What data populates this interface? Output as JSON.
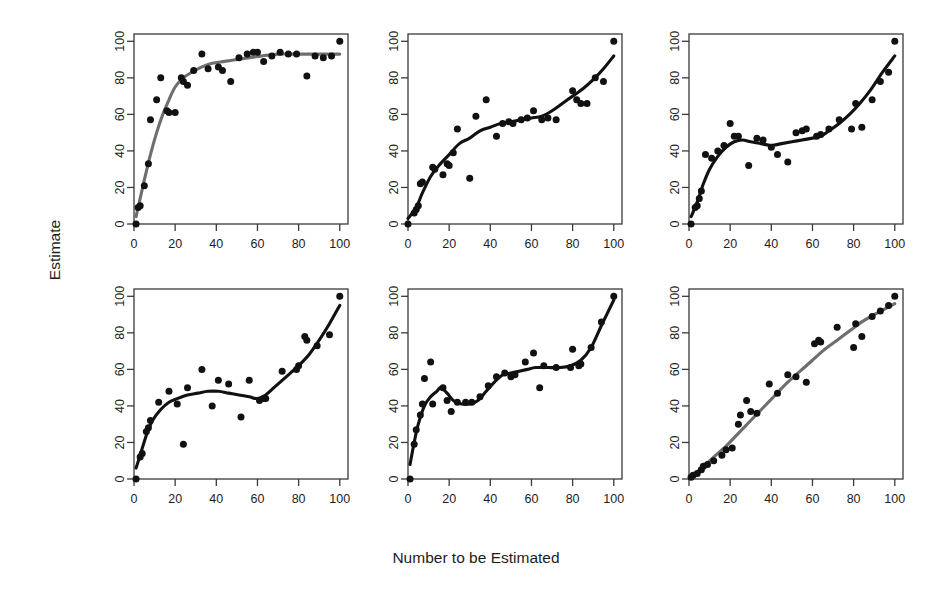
{
  "figure": {
    "xlabel": "Number to be Estimated",
    "ylabel": "Estimate",
    "layout": {
      "rows": 2,
      "cols": 3
    }
  },
  "chart_data": [
    {
      "panel": 1,
      "position": "top-left",
      "type": "scatter",
      "title": "",
      "xlabel": "Number to be Estimated",
      "ylabel": "Estimate",
      "xlim": [
        0,
        104
      ],
      "ylim": [
        0,
        104
      ],
      "xticks": [
        0,
        20,
        40,
        60,
        80,
        100
      ],
      "yticks": [
        0,
        20,
        40,
        60,
        80,
        100
      ],
      "grid": false,
      "legend": "none",
      "point_color": "#111111",
      "curve_color": "#6e6e6e",
      "curve_style": "loess-smooth",
      "points": [
        [
          1,
          0
        ],
        [
          2,
          9
        ],
        [
          3,
          10
        ],
        [
          5,
          21
        ],
        [
          7,
          33
        ],
        [
          8,
          57
        ],
        [
          11,
          68
        ],
        [
          13,
          80
        ],
        [
          16,
          62
        ],
        [
          17,
          61
        ],
        [
          20,
          61
        ],
        [
          23,
          80
        ],
        [
          24,
          78
        ],
        [
          26,
          76
        ],
        [
          29,
          84
        ],
        [
          33,
          93
        ],
        [
          36,
          85
        ],
        [
          41,
          86
        ],
        [
          43,
          84
        ],
        [
          47,
          78
        ],
        [
          51,
          91
        ],
        [
          55,
          93
        ],
        [
          58,
          94
        ],
        [
          60,
          94
        ],
        [
          63,
          89
        ],
        [
          67,
          92
        ],
        [
          71,
          94
        ],
        [
          75,
          93
        ],
        [
          79,
          93
        ],
        [
          84,
          81
        ],
        [
          88,
          92
        ],
        [
          92,
          91
        ],
        [
          96,
          92
        ],
        [
          100,
          100
        ]
      ],
      "curve": [
        [
          1,
          4
        ],
        [
          3,
          14
        ],
        [
          5,
          24
        ],
        [
          8,
          38
        ],
        [
          11,
          50
        ],
        [
          14,
          60
        ],
        [
          17,
          68
        ],
        [
          20,
          75
        ],
        [
          24,
          80
        ],
        [
          28,
          83
        ],
        [
          33,
          86
        ],
        [
          38,
          88
        ],
        [
          44,
          89
        ],
        [
          50,
          90
        ],
        [
          56,
          91
        ],
        [
          62,
          92
        ],
        [
          70,
          93
        ],
        [
          78,
          93
        ],
        [
          86,
          93
        ],
        [
          94,
          93
        ],
        [
          100,
          93
        ]
      ]
    },
    {
      "panel": 2,
      "position": "top-center",
      "type": "scatter",
      "title": "",
      "xlabel": "Number to be Estimated",
      "ylabel": "Estimate",
      "xlim": [
        0,
        104
      ],
      "ylim": [
        0,
        104
      ],
      "xticks": [
        0,
        20,
        40,
        60,
        80,
        100
      ],
      "yticks": [
        0,
        20,
        40,
        60,
        80,
        100
      ],
      "grid": false,
      "legend": "none",
      "point_color": "#111111",
      "curve_color": "#111111",
      "curve_style": "loess-smooth",
      "points": [
        [
          0,
          0
        ],
        [
          3,
          6
        ],
        [
          4,
          8
        ],
        [
          5,
          10
        ],
        [
          6,
          22
        ],
        [
          7,
          23
        ],
        [
          12,
          31
        ],
        [
          13,
          30
        ],
        [
          17,
          27
        ],
        [
          19,
          33
        ],
        [
          20,
          32
        ],
        [
          22,
          39
        ],
        [
          24,
          52
        ],
        [
          30,
          25
        ],
        [
          33,
          59
        ],
        [
          38,
          68
        ],
        [
          43,
          48
        ],
        [
          46,
          55
        ],
        [
          49,
          56
        ],
        [
          51,
          55
        ],
        [
          55,
          57
        ],
        [
          58,
          58
        ],
        [
          61,
          62
        ],
        [
          65,
          57
        ],
        [
          68,
          58
        ],
        [
          72,
          57
        ],
        [
          80,
          73
        ],
        [
          82,
          68
        ],
        [
          84,
          66
        ],
        [
          87,
          66
        ],
        [
          91,
          80
        ],
        [
          95,
          78
        ],
        [
          100,
          100
        ]
      ],
      "curve": [
        [
          0,
          3
        ],
        [
          4,
          9
        ],
        [
          7,
          17
        ],
        [
          11,
          26
        ],
        [
          15,
          32
        ],
        [
          20,
          38
        ],
        [
          25,
          44
        ],
        [
          30,
          47
        ],
        [
          35,
          51
        ],
        [
          40,
          53
        ],
        [
          45,
          55
        ],
        [
          50,
          56
        ],
        [
          55,
          57
        ],
        [
          60,
          58
        ],
        [
          65,
          59
        ],
        [
          70,
          62
        ],
        [
          75,
          66
        ],
        [
          80,
          70
        ],
        [
          85,
          74
        ],
        [
          90,
          79
        ],
        [
          95,
          85
        ],
        [
          100,
          92
        ]
      ]
    },
    {
      "panel": 3,
      "position": "top-right",
      "type": "scatter",
      "title": "",
      "xlabel": "Number to be Estimated",
      "ylabel": "Estimate",
      "xlim": [
        0,
        104
      ],
      "ylim": [
        0,
        104
      ],
      "xticks": [
        0,
        20,
        40,
        60,
        80,
        100
      ],
      "yticks": [
        0,
        20,
        40,
        60,
        80,
        100
      ],
      "grid": false,
      "legend": "none",
      "point_color": "#111111",
      "curve_color": "#111111",
      "curve_style": "loess-smooth",
      "points": [
        [
          1,
          0
        ],
        [
          3,
          9
        ],
        [
          4,
          10
        ],
        [
          5,
          14
        ],
        [
          6,
          18
        ],
        [
          8,
          38
        ],
        [
          11,
          36
        ],
        [
          14,
          40
        ],
        [
          17,
          43
        ],
        [
          20,
          55
        ],
        [
          22,
          48
        ],
        [
          24,
          48
        ],
        [
          29,
          32
        ],
        [
          33,
          47
        ],
        [
          36,
          46
        ],
        [
          40,
          42
        ],
        [
          43,
          38
        ],
        [
          48,
          34
        ],
        [
          52,
          50
        ],
        [
          55,
          51
        ],
        [
          57,
          52
        ],
        [
          62,
          48
        ],
        [
          64,
          49
        ],
        [
          68,
          52
        ],
        [
          73,
          57
        ],
        [
          79,
          52
        ],
        [
          81,
          66
        ],
        [
          84,
          53
        ],
        [
          89,
          68
        ],
        [
          93,
          78
        ],
        [
          97,
          83
        ],
        [
          100,
          100
        ]
      ],
      "curve": [
        [
          1,
          4
        ],
        [
          4,
          12
        ],
        [
          7,
          22
        ],
        [
          10,
          30
        ],
        [
          14,
          37
        ],
        [
          18,
          42
        ],
        [
          22,
          45
        ],
        [
          26,
          46
        ],
        [
          30,
          45
        ],
        [
          35,
          44
        ],
        [
          40,
          43
        ],
        [
          45,
          44
        ],
        [
          50,
          45
        ],
        [
          55,
          46
        ],
        [
          60,
          47
        ],
        [
          64,
          48
        ],
        [
          68,
          51
        ],
        [
          73,
          55
        ],
        [
          78,
          60
        ],
        [
          83,
          66
        ],
        [
          88,
          73
        ],
        [
          94,
          83
        ],
        [
          100,
          92
        ]
      ]
    },
    {
      "panel": 4,
      "position": "bottom-left",
      "type": "scatter",
      "title": "",
      "xlabel": "Number to be Estimated",
      "ylabel": "Estimate",
      "xlim": [
        0,
        104
      ],
      "ylim": [
        0,
        104
      ],
      "xticks": [
        0,
        20,
        40,
        60,
        80,
        100
      ],
      "yticks": [
        0,
        20,
        40,
        60,
        80,
        100
      ],
      "grid": false,
      "legend": "none",
      "point_color": "#111111",
      "curve_color": "#111111",
      "curve_style": "loess-smooth",
      "points": [
        [
          1,
          0
        ],
        [
          3,
          12
        ],
        [
          4,
          14
        ],
        [
          6,
          26
        ],
        [
          7,
          28
        ],
        [
          8,
          32
        ],
        [
          12,
          42
        ],
        [
          17,
          48
        ],
        [
          21,
          41
        ],
        [
          24,
          19
        ],
        [
          26,
          50
        ],
        [
          33,
          60
        ],
        [
          38,
          40
        ],
        [
          41,
          54
        ],
        [
          46,
          52
        ],
        [
          52,
          34
        ],
        [
          56,
          54
        ],
        [
          61,
          43
        ],
        [
          63,
          44
        ],
        [
          64,
          44
        ],
        [
          72,
          59
        ],
        [
          79,
          60
        ],
        [
          80,
          62
        ],
        [
          84,
          76
        ],
        [
          83,
          78
        ],
        [
          89,
          73
        ],
        [
          95,
          79
        ],
        [
          100,
          100
        ]
      ],
      "curve": [
        [
          1,
          6
        ],
        [
          3,
          13
        ],
        [
          6,
          24
        ],
        [
          9,
          32
        ],
        [
          13,
          38
        ],
        [
          17,
          42
        ],
        [
          21,
          44
        ],
        [
          26,
          46
        ],
        [
          31,
          47
        ],
        [
          36,
          48
        ],
        [
          41,
          48
        ],
        [
          46,
          47
        ],
        [
          51,
          46
        ],
        [
          56,
          45
        ],
        [
          60,
          44
        ],
        [
          64,
          46
        ],
        [
          68,
          50
        ],
        [
          72,
          54
        ],
        [
          76,
          58
        ],
        [
          80,
          62
        ],
        [
          85,
          68
        ],
        [
          90,
          76
        ],
        [
          95,
          85
        ],
        [
          100,
          95
        ]
      ]
    },
    {
      "panel": 5,
      "position": "bottom-center",
      "type": "scatter",
      "title": "",
      "xlabel": "Number to be Estimated",
      "ylabel": "Estimate",
      "xlim": [
        0,
        104
      ],
      "ylim": [
        0,
        104
      ],
      "xticks": [
        0,
        20,
        40,
        60,
        80,
        100
      ],
      "yticks": [
        0,
        20,
        40,
        60,
        80,
        100
      ],
      "grid": false,
      "legend": "none",
      "point_color": "#111111",
      "curve_color": "#111111",
      "curve_style": "loess-smooth",
      "points": [
        [
          1,
          0
        ],
        [
          3,
          19
        ],
        [
          4,
          27
        ],
        [
          6,
          35
        ],
        [
          7,
          41
        ],
        [
          8,
          55
        ],
        [
          11,
          64
        ],
        [
          12,
          41
        ],
        [
          17,
          50
        ],
        [
          19,
          43
        ],
        [
          21,
          37
        ],
        [
          24,
          42
        ],
        [
          28,
          42
        ],
        [
          31,
          42
        ],
        [
          35,
          45
        ],
        [
          39,
          51
        ],
        [
          43,
          56
        ],
        [
          47,
          58
        ],
        [
          50,
          56
        ],
        [
          52,
          57
        ],
        [
          57,
          64
        ],
        [
          61,
          69
        ],
        [
          64,
          50
        ],
        [
          66,
          62
        ],
        [
          72,
          61
        ],
        [
          79,
          61
        ],
        [
          80,
          71
        ],
        [
          83,
          62
        ],
        [
          84,
          63
        ],
        [
          89,
          72
        ],
        [
          94,
          86
        ],
        [
          100,
          100
        ]
      ],
      "curve": [
        [
          1,
          8
        ],
        [
          3,
          20
        ],
        [
          5,
          30
        ],
        [
          8,
          40
        ],
        [
          11,
          45
        ],
        [
          14,
          48
        ],
        [
          16,
          50
        ],
        [
          19,
          47
        ],
        [
          22,
          43
        ],
        [
          26,
          41
        ],
        [
          30,
          41
        ],
        [
          34,
          43
        ],
        [
          38,
          48
        ],
        [
          42,
          53
        ],
        [
          46,
          57
        ],
        [
          50,
          58
        ],
        [
          54,
          59
        ],
        [
          58,
          60
        ],
        [
          62,
          61
        ],
        [
          68,
          61
        ],
        [
          74,
          61
        ],
        [
          79,
          62
        ],
        [
          84,
          65
        ],
        [
          89,
          72
        ],
        [
          94,
          84
        ],
        [
          100,
          98
        ]
      ]
    },
    {
      "panel": 6,
      "position": "bottom-right",
      "type": "scatter",
      "title": "",
      "xlabel": "Number to be Estimated",
      "ylabel": "Estimate",
      "xlim": [
        0,
        104
      ],
      "ylim": [
        0,
        104
      ],
      "xticks": [
        0,
        20,
        40,
        60,
        80,
        100
      ],
      "yticks": [
        0,
        20,
        40,
        60,
        80,
        100
      ],
      "grid": false,
      "legend": "none",
      "point_color": "#111111",
      "curve_color": "#6e6e6e",
      "curve_style": "loess-smooth",
      "points": [
        [
          1,
          1
        ],
        [
          2,
          2
        ],
        [
          4,
          3
        ],
        [
          6,
          5
        ],
        [
          7,
          7
        ],
        [
          9,
          8
        ],
        [
          12,
          10
        ],
        [
          16,
          13
        ],
        [
          18,
          16
        ],
        [
          21,
          17
        ],
        [
          24,
          30
        ],
        [
          25,
          35
        ],
        [
          28,
          43
        ],
        [
          30,
          37
        ],
        [
          33,
          36
        ],
        [
          39,
          52
        ],
        [
          43,
          47
        ],
        [
          48,
          57
        ],
        [
          52,
          56
        ],
        [
          57,
          53
        ],
        [
          61,
          74
        ],
        [
          63,
          76
        ],
        [
          64,
          75
        ],
        [
          72,
          83
        ],
        [
          80,
          72
        ],
        [
          81,
          85
        ],
        [
          84,
          78
        ],
        [
          89,
          89
        ],
        [
          93,
          92
        ],
        [
          97,
          95
        ],
        [
          100,
          100
        ]
      ],
      "curve": [
        [
          1,
          1
        ],
        [
          6,
          6
        ],
        [
          12,
          12
        ],
        [
          18,
          18
        ],
        [
          24,
          25
        ],
        [
          30,
          32
        ],
        [
          36,
          39
        ],
        [
          42,
          46
        ],
        [
          48,
          53
        ],
        [
          54,
          59
        ],
        [
          60,
          65
        ],
        [
          66,
          71
        ],
        [
          72,
          76
        ],
        [
          78,
          81
        ],
        [
          84,
          86
        ],
        [
          90,
          90
        ],
        [
          95,
          93
        ],
        [
          100,
          96
        ]
      ]
    }
  ]
}
